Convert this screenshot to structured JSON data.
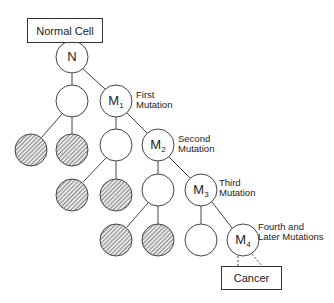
{
  "diagram": {
    "title_box": "Normal Cell",
    "end_box": "Cancer",
    "colors": {
      "stroke": "#333333",
      "hatch": "#555555",
      "background": "#ffffff"
    },
    "nodes": [
      {
        "id": "N",
        "label": "N",
        "sub": "",
        "cx": 72,
        "cy": 57,
        "type": "normal"
      },
      {
        "id": "A",
        "label": "",
        "sub": "",
        "cx": 72,
        "cy": 101,
        "type": "empty"
      },
      {
        "id": "M1",
        "label": "M",
        "sub": "1",
        "cx": 116,
        "cy": 101,
        "type": "mutant"
      },
      {
        "id": "H1",
        "label": "",
        "sub": "",
        "cx": 31,
        "cy": 150,
        "type": "hatched"
      },
      {
        "id": "H2",
        "label": "",
        "sub": "",
        "cx": 72,
        "cy": 150,
        "type": "hatched"
      },
      {
        "id": "B",
        "label": "",
        "sub": "",
        "cx": 116,
        "cy": 145,
        "type": "empty"
      },
      {
        "id": "M2",
        "label": "M",
        "sub": "2",
        "cx": 158,
        "cy": 145,
        "type": "mutant"
      },
      {
        "id": "H3",
        "label": "",
        "sub": "",
        "cx": 72,
        "cy": 195,
        "type": "hatched"
      },
      {
        "id": "H4",
        "label": "",
        "sub": "",
        "cx": 116,
        "cy": 195,
        "type": "hatched"
      },
      {
        "id": "C",
        "label": "",
        "sub": "",
        "cx": 158,
        "cy": 190,
        "type": "empty"
      },
      {
        "id": "M3",
        "label": "M",
        "sub": "3",
        "cx": 201,
        "cy": 190,
        "type": "mutant"
      },
      {
        "id": "H5",
        "label": "",
        "sub": "",
        "cx": 116,
        "cy": 240,
        "type": "hatched"
      },
      {
        "id": "H6",
        "label": "",
        "sub": "",
        "cx": 158,
        "cy": 240,
        "type": "hatched"
      },
      {
        "id": "D",
        "label": "",
        "sub": "",
        "cx": 201,
        "cy": 240,
        "type": "empty"
      },
      {
        "id": "M4",
        "label": "M",
        "sub": "4",
        "cx": 243,
        "cy": 240,
        "type": "mutant"
      }
    ],
    "edges": [
      [
        "N",
        "A"
      ],
      [
        "N",
        "M1"
      ],
      [
        "A",
        "H1"
      ],
      [
        "A",
        "H2"
      ],
      [
        "M1",
        "B"
      ],
      [
        "M1",
        "M2"
      ],
      [
        "B",
        "H3"
      ],
      [
        "B",
        "H4"
      ],
      [
        "M2",
        "C"
      ],
      [
        "M2",
        "M3"
      ],
      [
        "C",
        "H5"
      ],
      [
        "C",
        "H6"
      ],
      [
        "M3",
        "D"
      ],
      [
        "M3",
        "M4"
      ]
    ],
    "annotations": {
      "first": [
        "First",
        "Mutation"
      ],
      "second": [
        "Second",
        "Mutation"
      ],
      "third": [
        "Third",
        "Mutation"
      ],
      "fourth": [
        "Fourth and",
        "Later Mutations"
      ]
    },
    "node_labels": {
      "N": "N",
      "M1": "M",
      "M1_sub": "1",
      "M2": "M",
      "M2_sub": "2",
      "M3": "M",
      "M3_sub": "3",
      "M4": "M",
      "M4_sub": "4"
    }
  }
}
